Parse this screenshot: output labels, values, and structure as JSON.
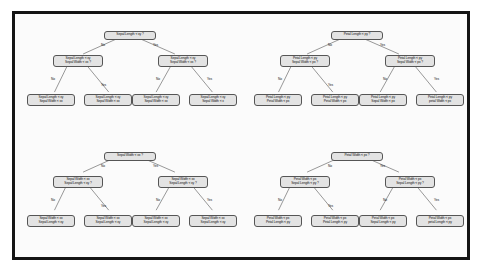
{
  "figure": {
    "background_color": "#ffffff",
    "frame_color": "#141414",
    "node_fill": "#e3e3e3",
    "node_border": "#555555",
    "edge_color": "#6a6a6a"
  },
  "edge_labels": {
    "no": "No",
    "yes": "Yes"
  },
  "trees": [
    {
      "id": "tree-top-left",
      "root": {
        "lines": [
          "Sepal Length < xy ?"
        ]
      },
      "internal": [
        {
          "lines": [
            "Sepal Length < xy",
            "Sepal Width < xx ?"
          ]
        },
        {
          "lines": [
            "Sepal Length < xy",
            "Sepal Width < xx ?"
          ]
        }
      ],
      "leaves": [
        {
          "lines": [
            "Sepal Length < xy",
            "Sepal Width < xx"
          ]
        },
        {
          "lines": [
            "Sepal Length < xy",
            "Sepal Width < xx"
          ]
        },
        {
          "lines": [
            "Sepal Length < xy",
            "Sepal Width < xx"
          ]
        },
        {
          "lines": [
            "Sepal Length < xy",
            "Sepal Width < x"
          ]
        }
      ]
    },
    {
      "id": "tree-top-right",
      "root": {
        "lines": [
          "Petal Length < py ?"
        ]
      },
      "internal": [
        {
          "lines": [
            "Petal Length < py",
            "Sepal Width < px ?"
          ]
        },
        {
          "lines": [
            "Petal Length < py",
            "Sepal Width < px ?"
          ]
        }
      ],
      "leaves": [
        {
          "lines": [
            "Petal Length < py",
            "Petal Width < px"
          ]
        },
        {
          "lines": [
            "Petal Length < py",
            "Petal Width < px"
          ]
        },
        {
          "lines": [
            "Petal Length < py",
            "Sepal Width < px"
          ]
        },
        {
          "lines": [
            "Petal Length < py",
            "petal Width < px"
          ]
        }
      ]
    },
    {
      "id": "tree-bottom-left",
      "root": {
        "lines": [
          "Sepal Width < xx ?"
        ]
      },
      "internal": [
        {
          "lines": [
            "Sepal Width < xx",
            "Sepal Length < xy ?"
          ]
        },
        {
          "lines": [
            "Sepal Width < xx",
            "Sepal Length < xy ?"
          ]
        }
      ],
      "leaves": [
        {
          "lines": [
            "Sepal Width < xx",
            "Sepal Length < xy"
          ]
        },
        {
          "lines": [
            "Sepal Width < xx",
            "Sepal Length < xy"
          ]
        },
        {
          "lines": [
            "Sepal Width < xx",
            "Sepal Length < xy"
          ]
        },
        {
          "lines": [
            "Sepal Width < xx",
            "Sepal Length < xy"
          ]
        }
      ]
    },
    {
      "id": "tree-bottom-right",
      "root": {
        "lines": [
          "Petal Width < px ?"
        ]
      },
      "internal": [
        {
          "lines": [
            "Petal Width < px",
            "Sepal Length < py ?"
          ]
        },
        {
          "lines": [
            "Petal Width < px",
            "Sepal Length < py ?"
          ]
        }
      ],
      "leaves": [
        {
          "lines": [
            "Petal Width < px",
            "Petal Length < py"
          ]
        },
        {
          "lines": [
            "Petal Width < px",
            "Petal Length < py"
          ]
        },
        {
          "lines": [
            "Petal Width < px",
            "Sepal Length < py"
          ]
        },
        {
          "lines": [
            "Petal Width < px",
            "petal Length < py"
          ]
        }
      ]
    }
  ]
}
